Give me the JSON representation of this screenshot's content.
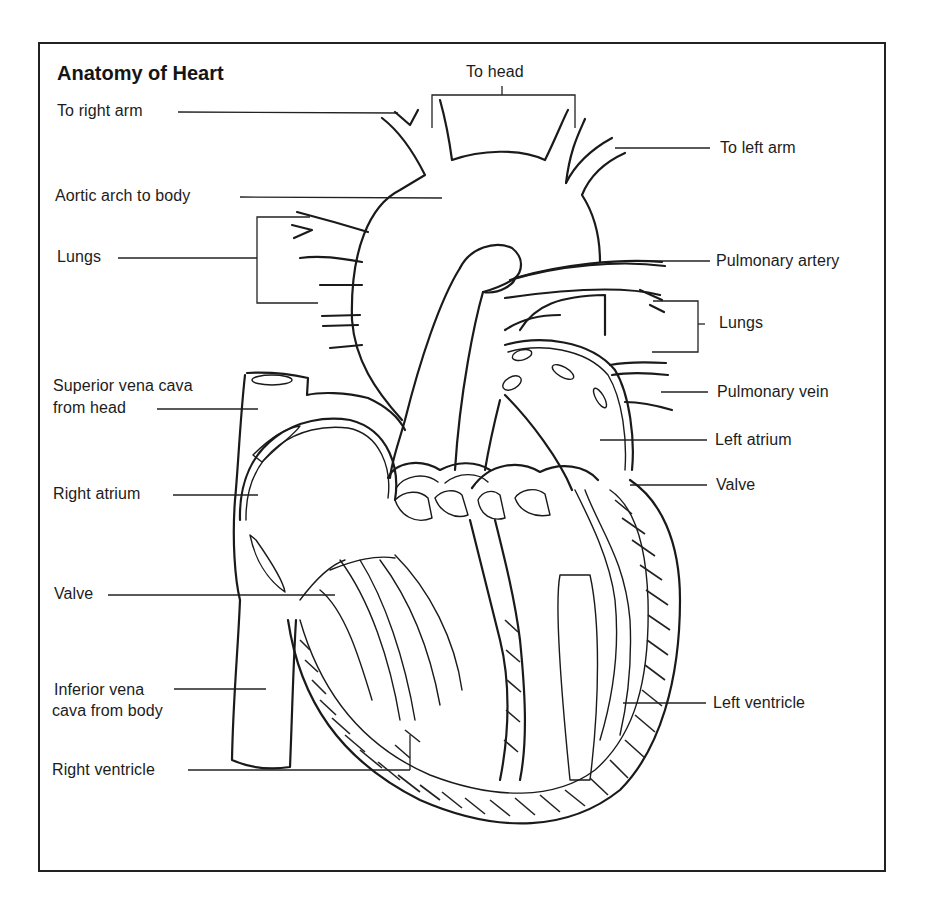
{
  "title": "Anatomy of Heart",
  "labels": {
    "to_head": "To head",
    "to_right_arm": "To right arm",
    "to_left_arm": "To left arm",
    "aortic_arch": "Aortic arch to body",
    "lungs_left": "Lungs",
    "pulmonary_artery": "Pulmonary artery",
    "lungs_right": "Lungs",
    "superior_vena_cava_line1": "Superior vena cava",
    "superior_vena_cava_line2": "from head",
    "pulmonary_vein": "Pulmonary vein",
    "left_atrium": "Left atrium",
    "valve_right": "Valve",
    "right_atrium": "Right atrium",
    "valve_left": "Valve",
    "inferior_vena_cava_line1": "Inferior vena",
    "inferior_vena_cava_line2": "cava from body",
    "left_ventricle": "Left ventricle",
    "right_ventricle": "Right ventricle"
  },
  "colors": {
    "ink": "#1a1a1a",
    "background": "#ffffff"
  }
}
